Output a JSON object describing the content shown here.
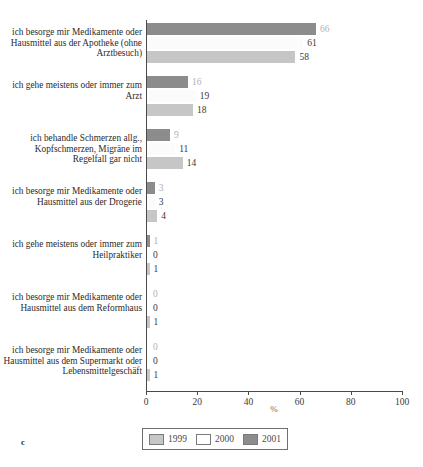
{
  "figure": {
    "caption_letter": "c",
    "title_remnant": ""
  },
  "chart_data": {
    "type": "bar",
    "orientation": "horizontal",
    "title": "",
    "xlabel": "%",
    "ylabel": "",
    "xlim": [
      0,
      100
    ],
    "xticks": [
      0,
      20,
      40,
      60,
      80,
      100
    ],
    "xtick_labels": [
      "0",
      "20",
      "40",
      "60",
      "80",
      "100"
    ],
    "grid": false,
    "legend_position": "bottom",
    "bar_order_top_to_bottom": [
      "2001",
      "2000",
      "1999"
    ],
    "categories": [
      "ich besorge mir Medikamente oder Hausmittel aus der Apotheke (ohne Arztbesuch)",
      "ich gehe meistens oder immer zum Arzt",
      "ich behandle Schmerzen allg., Kopfschmerzen, Migräne im Regelfall gar nicht",
      "ich besorge mir Medikamente oder Hausmittel aus der Drogerie",
      "ich gehe meistens oder immer zum Heilpraktiker",
      "ich besorge mir Medikamente oder Hausmittel aus dem Reformhaus",
      "ich besorge mir Medikamente oder Hausmittel aus dem Supermarkt oder Lebensmittelgeschäft"
    ],
    "series": [
      {
        "name": "1999",
        "color": "#c6c6c6",
        "values": [
          58,
          18,
          14,
          4,
          1,
          1,
          1
        ]
      },
      {
        "name": "2000",
        "color": "#ffffff",
        "values": [
          61,
          19,
          11,
          3,
          0,
          0,
          0
        ]
      },
      {
        "name": "2001",
        "color": "#8c8c8c",
        "values": [
          66,
          16,
          9,
          3,
          1,
          0,
          0
        ]
      }
    ]
  },
  "legend": {
    "items": [
      {
        "label": "1999",
        "swatch": "y1999"
      },
      {
        "label": "2000",
        "swatch": "y2000"
      },
      {
        "label": "2001",
        "swatch": "y2001"
      }
    ]
  }
}
